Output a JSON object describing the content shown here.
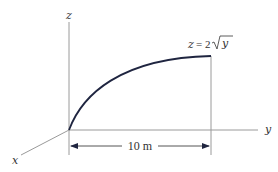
{
  "diagram": {
    "axes": {
      "z_label": "z",
      "y_label": "y",
      "x_label": "x"
    },
    "curve": {
      "equation_lhs": "z",
      "equation_eq": "=",
      "equation_coef": "2",
      "equation_radicand": "y",
      "color": "#1f2540"
    },
    "dimension": {
      "label": "10 m"
    },
    "colors": {
      "axis": "#9a9a9a",
      "text": "#333333"
    }
  }
}
